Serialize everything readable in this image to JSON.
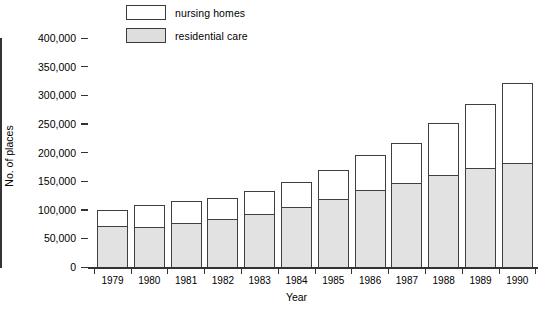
{
  "chart_data": {
    "type": "bar",
    "subtype": "stacked",
    "title": "",
    "xlabel": "Year",
    "ylabel": "No. of places",
    "ylim": [
      0,
      400000
    ],
    "ytick_values": [
      0,
      50000,
      100000,
      150000,
      200000,
      250000,
      300000,
      350000,
      400000
    ],
    "ytick_labels": [
      "0",
      "50,000",
      "100,000",
      "150,000",
      "200,000",
      "250,000",
      "300,000",
      "350,000",
      "400,000"
    ],
    "grid": false,
    "legend_position": "top-left",
    "categories": [
      "1979",
      "1980",
      "1981",
      "1982",
      "1983",
      "1984",
      "1985",
      "1986",
      "1987",
      "1988",
      "1989",
      "1990"
    ],
    "series": [
      {
        "name": "residential care",
        "color": "#e2e2e2",
        "values": [
          72000,
          69000,
          77000,
          83000,
          93000,
          105000,
          119000,
          135000,
          146000,
          160000,
          173000,
          181000
        ]
      },
      {
        "name": "nursing homes",
        "color": "#ffffff",
        "values": [
          28000,
          39000,
          38000,
          38000,
          39000,
          44000,
          50000,
          60000,
          70000,
          92000,
          111000,
          140000
        ]
      }
    ],
    "totals": [
      100000,
      108000,
      115000,
      121000,
      132000,
      149000,
      169000,
      195000,
      216000,
      252000,
      284000,
      321000
    ]
  },
  "legend": {
    "items": [
      {
        "label": "nursing homes",
        "swatch": "white"
      },
      {
        "label": "residential care",
        "swatch": "grey"
      }
    ]
  },
  "axes": {
    "y_title": "No. of places",
    "x_title": "Year"
  }
}
